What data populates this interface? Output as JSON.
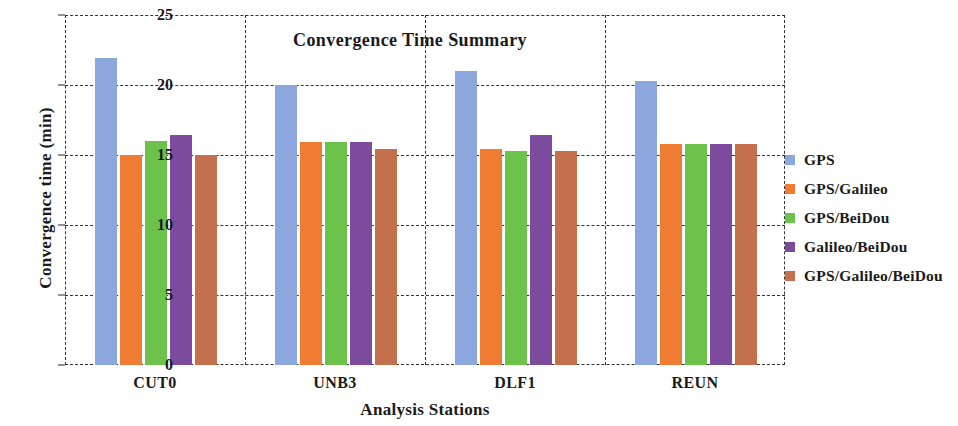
{
  "chart_data": {
    "type": "bar",
    "title": "Convergence Time Summary",
    "xlabel": "Analysis Stations",
    "ylabel": "Convergence time (min)",
    "categories": [
      "CUT0",
      "UNB3",
      "DLF1",
      "REUN"
    ],
    "ylim": [
      0,
      25
    ],
    "yticks": [
      0,
      5,
      10,
      15,
      20,
      25
    ],
    "grid": true,
    "legend_position": "right",
    "series": [
      {
        "name": "GPS",
        "color": "#8CA7DE",
        "values": [
          21.9,
          20.0,
          21.0,
          20.3
        ]
      },
      {
        "name": "GPS/Galileo",
        "color": "#F07C33",
        "values": [
          15.0,
          15.9,
          15.4,
          15.8
        ]
      },
      {
        "name": "GPS/BeiDou",
        "color": "#6DC24B",
        "values": [
          16.0,
          15.9,
          15.3,
          15.8
        ]
      },
      {
        "name": "Galileo/BeiDou",
        "color": "#7C4B9E",
        "values": [
          16.4,
          15.9,
          16.4,
          15.8
        ]
      },
      {
        "name": "GPS/Galileo/BeiDou",
        "color": "#C5704C",
        "values": [
          15.0,
          15.4,
          15.3,
          15.8
        ]
      }
    ]
  }
}
